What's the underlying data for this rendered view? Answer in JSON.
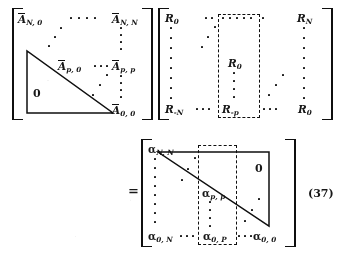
{
  "figure": {
    "equation_number": "(37)",
    "equals_sign": "=",
    "description": "Matrix factorization identity relating triangular A-bar matrix, Toeplitz R matrix, and alpha matrix"
  },
  "matrix_a": {
    "name": "A-bar matrix",
    "zero_label": "0",
    "entries": {
      "top_left": {
        "base": "A",
        "sub": "N, 0"
      },
      "top_right": {
        "base": "A",
        "sub": "N, N"
      },
      "mid_left": {
        "base": "A",
        "sub": "p, 0"
      },
      "mid_right": {
        "base": "A",
        "sub": "p, p"
      },
      "bottom_right": {
        "base": "A",
        "sub": "0, 0"
      }
    }
  },
  "matrix_r": {
    "name": "R correlation matrix",
    "entries": {
      "top_left": {
        "base": "R",
        "sub": "0"
      },
      "top_right": {
        "base": "R",
        "sub": "N"
      },
      "center": {
        "base": "R",
        "sub": "0"
      },
      "bottom_left": {
        "base": "R",
        "sub": "-N"
      },
      "bottom_center": {
        "base": "R",
        "sub": "-p"
      },
      "bottom_right": {
        "base": "R",
        "sub": "0"
      }
    }
  },
  "matrix_alpha": {
    "name": "alpha matrix",
    "zero_label": "0",
    "entries": {
      "top_left": {
        "base": "α",
        "sub": "N, N"
      },
      "center": {
        "base": "α",
        "sub": "p, p"
      },
      "bottom_left": {
        "base": "α",
        "sub": "0, N"
      },
      "bottom_center": {
        "base": "α",
        "sub": "0, P"
      },
      "bottom_right": {
        "base": "α",
        "sub": "0, 0"
      }
    }
  }
}
